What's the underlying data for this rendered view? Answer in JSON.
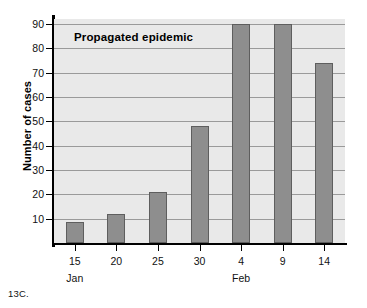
{
  "chart_data": {
    "type": "bar",
    "title": "Propagated epidemic",
    "xlabel": "",
    "ylabel": "Number of cases",
    "categories": [
      "15",
      "20",
      "25",
      "30",
      "4",
      "9",
      "14"
    ],
    "month_groups": [
      {
        "label": "Jan",
        "at_category": "15"
      },
      {
        "label": "Feb",
        "at_category": "4"
      }
    ],
    "values": [
      8.5,
      12,
      21,
      48,
      90,
      90,
      74
    ],
    "ylim": [
      0,
      92
    ],
    "yticks": [
      10,
      20,
      30,
      40,
      50,
      60,
      70,
      80,
      90
    ],
    "ytick_labels": [
      "10",
      "20",
      "30",
      "40",
      "50",
      "60",
      "70",
      "80",
      "90"
    ],
    "grid": true,
    "legend": "none",
    "bar_color": "#8e8e8e",
    "bar_edge_color": "#5e5e5e",
    "plot_background": "#e9e9e9",
    "axis_color": "#000000",
    "gridline_color": "#9a9a9a"
  },
  "caption": "13C."
}
